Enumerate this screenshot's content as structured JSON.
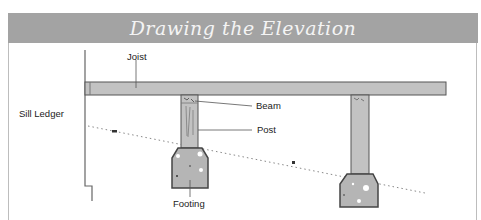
{
  "header": {
    "title": "Drawing the Elevation",
    "background_color": "#a3a3a3",
    "text_color": "#f4f4f4"
  },
  "labels": {
    "joist": "Joist",
    "sill_ledger": "Sill Ledger",
    "beam": "Beam",
    "post": "Post",
    "footing": "Footing"
  },
  "colors": {
    "member_fill": "#c2c2c2",
    "outline": "#555555",
    "concrete_fill": "#b5b5b5"
  }
}
